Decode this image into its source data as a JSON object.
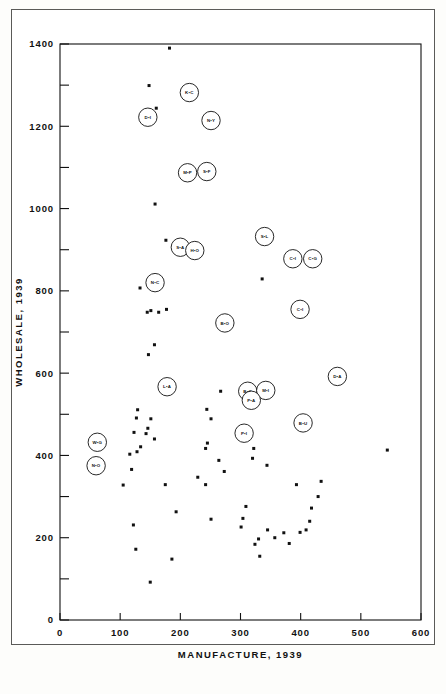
{
  "figure": {
    "title": "",
    "background_color": "#ffffff",
    "frame_color": "#5a5a58",
    "ink_color": "#111111"
  },
  "chart_data": {
    "type": "scatter",
    "title": "",
    "subtitle": "",
    "xlabel": "MANUFACTURE, 1939",
    "ylabel": "WHOLESALE, 1939",
    "xlim": [
      0,
      600
    ],
    "ylim": [
      0,
      1400
    ],
    "xticks": [
      0,
      100,
      200,
      300,
      400,
      500,
      600
    ],
    "xtick_labels": [
      "0",
      "100",
      "200",
      "300",
      "400",
      "500",
      "600"
    ],
    "yticks": [
      0,
      200,
      400,
      600,
      800,
      1000,
      1200,
      1400
    ],
    "ytick_labels": [
      "0",
      "200",
      "400",
      "600",
      "800",
      "1000",
      "1200",
      "1400"
    ],
    "yminor_ticks": [
      100,
      300,
      500,
      700,
      900,
      1100,
      1300
    ],
    "grid": false,
    "legend": false,
    "marker": "filled-square-dot",
    "labeled_points": [
      {
        "label": "K•C",
        "x": 215,
        "y": 1282
      },
      {
        "label": "D•I",
        "x": 146,
        "y": 1222
      },
      {
        "label": "N•Y",
        "x": 251,
        "y": 1214
      },
      {
        "label": "M•P",
        "x": 212,
        "y": 1087
      },
      {
        "label": "S•F",
        "x": 244,
        "y": 1090
      },
      {
        "label": "S•L",
        "x": 340,
        "y": 932
      },
      {
        "label": "S•A",
        "x": 200,
        "y": 906
      },
      {
        "label": "H•O",
        "x": 224,
        "y": 898
      },
      {
        "label": "C•I",
        "x": 387,
        "y": 878
      },
      {
        "label": "C•G",
        "x": 420,
        "y": 878
      },
      {
        "label": "N•C",
        "x": 158,
        "y": 820
      },
      {
        "label": "C•I",
        "x": 399,
        "y": 755
      },
      {
        "label": "B•O",
        "x": 274,
        "y": 722
      },
      {
        "label": "D•A",
        "x": 461,
        "y": 592
      },
      {
        "label": "L•A",
        "x": 178,
        "y": 567
      },
      {
        "label": "B•O",
        "x": 312,
        "y": 556
      },
      {
        "label": "M•I",
        "x": 342,
        "y": 558
      },
      {
        "label": "P•A",
        "x": 318,
        "y": 534
      },
      {
        "label": "B•U",
        "x": 404,
        "y": 479
      },
      {
        "label": "P•I",
        "x": 306,
        "y": 454
      },
      {
        "label": "W•G",
        "x": 62,
        "y": 432
      },
      {
        "label": "N•O",
        "x": 60,
        "y": 375
      }
    ],
    "plain_points": [
      {
        "x": 182,
        "y": 1390
      },
      {
        "x": 148,
        "y": 1299
      },
      {
        "x": 160,
        "y": 1244
      },
      {
        "x": 158,
        "y": 1011
      },
      {
        "x": 176,
        "y": 923
      },
      {
        "x": 336,
        "y": 829
      },
      {
        "x": 133,
        "y": 807
      },
      {
        "x": 151,
        "y": 752
      },
      {
        "x": 145,
        "y": 748
      },
      {
        "x": 164,
        "y": 748
      },
      {
        "x": 177,
        "y": 755
      },
      {
        "x": 157,
        "y": 669
      },
      {
        "x": 147,
        "y": 645
      },
      {
        "x": 129,
        "y": 511
      },
      {
        "x": 127,
        "y": 491
      },
      {
        "x": 123,
        "y": 456
      },
      {
        "x": 151,
        "y": 489
      },
      {
        "x": 146,
        "y": 466
      },
      {
        "x": 143,
        "y": 453
      },
      {
        "x": 157,
        "y": 440
      },
      {
        "x": 134,
        "y": 421
      },
      {
        "x": 128,
        "y": 409
      },
      {
        "x": 116,
        "y": 403
      },
      {
        "x": 119,
        "y": 366
      },
      {
        "x": 267,
        "y": 556
      },
      {
        "x": 244,
        "y": 512
      },
      {
        "x": 251,
        "y": 489
      },
      {
        "x": 245,
        "y": 430
      },
      {
        "x": 242,
        "y": 417
      },
      {
        "x": 264,
        "y": 388
      },
      {
        "x": 322,
        "y": 417
      },
      {
        "x": 320,
        "y": 393
      },
      {
        "x": 344,
        "y": 376
      },
      {
        "x": 273,
        "y": 361
      },
      {
        "x": 229,
        "y": 347
      },
      {
        "x": 105,
        "y": 328
      },
      {
        "x": 175,
        "y": 329
      },
      {
        "x": 242,
        "y": 329
      },
      {
        "x": 393,
        "y": 329
      },
      {
        "x": 434,
        "y": 337
      },
      {
        "x": 429,
        "y": 300
      },
      {
        "x": 418,
        "y": 272
      },
      {
        "x": 309,
        "y": 276
      },
      {
        "x": 193,
        "y": 263
      },
      {
        "x": 304,
        "y": 247
      },
      {
        "x": 251,
        "y": 245
      },
      {
        "x": 415,
        "y": 240
      },
      {
        "x": 301,
        "y": 226
      },
      {
        "x": 345,
        "y": 219
      },
      {
        "x": 122,
        "y": 231
      },
      {
        "x": 409,
        "y": 219
      },
      {
        "x": 399,
        "y": 213
      },
      {
        "x": 372,
        "y": 212
      },
      {
        "x": 357,
        "y": 200
      },
      {
        "x": 330,
        "y": 197
      },
      {
        "x": 324,
        "y": 184
      },
      {
        "x": 381,
        "y": 186
      },
      {
        "x": 332,
        "y": 155
      },
      {
        "x": 186,
        "y": 148
      },
      {
        "x": 126,
        "y": 172
      },
      {
        "x": 150,
        "y": 92
      },
      {
        "x": 544,
        "y": 413
      }
    ]
  },
  "caption": {
    "line1": "",
    "line2": ""
  }
}
